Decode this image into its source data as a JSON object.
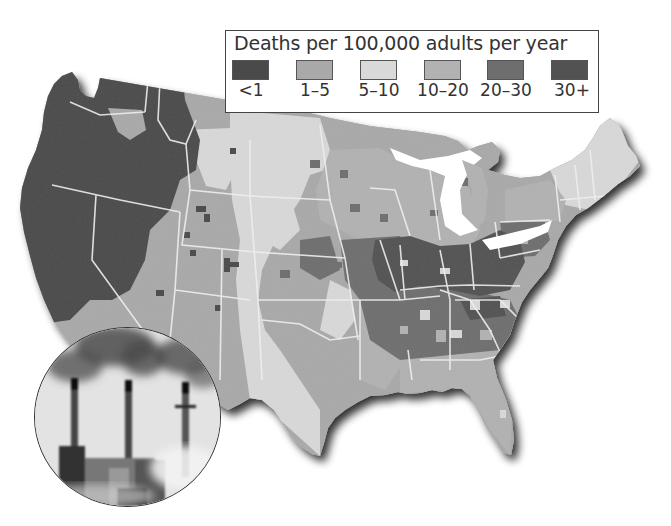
{
  "legend": {
    "title": "Deaths per 100,000 adults per year",
    "items": [
      {
        "label": "<1",
        "color": "#4a4a4a"
      },
      {
        "label": "1–5",
        "color": "#a9a9a9"
      },
      {
        "label": "5–10",
        "color": "#d9d9d9"
      },
      {
        "label": "10–20",
        "color": "#b2b2b2"
      },
      {
        "label": "20–30",
        "color": "#6e6e6e"
      },
      {
        "label": "30+",
        "color": "#525252"
      }
    ]
  },
  "map": {
    "subject": "Contiguous United States county-level death rates attributable to air pollution",
    "regions": [
      {
        "name": "Pacific Northwest & California coast",
        "category": "<1"
      },
      {
        "name": "Nevada / Idaho / western Montana",
        "category": "<1"
      },
      {
        "name": "Northern Rockies & Great Basin",
        "category": "1–5"
      },
      {
        "name": "Northern & Central Great Plains",
        "category": "5–10"
      },
      {
        "name": "Southwest (Arizona, New Mexico)",
        "category": "1–5"
      },
      {
        "name": "Texas & Oklahoma",
        "category": "5–10"
      },
      {
        "name": "Upper Midwest (Minnesota, Wisconsin, Michigan)",
        "category": "10–20"
      },
      {
        "name": "Ohio Valley (Illinois, Indiana, Ohio, Kentucky, West Virginia)",
        "category": "30+"
      },
      {
        "name": "Mid-South (Tennessee, Arkansas, Alabama, Georgia)",
        "category": "20–30"
      },
      {
        "name": "Pennsylvania & Mid-Atlantic",
        "category": "20–30"
      },
      {
        "name": "New York",
        "category": "10–20"
      },
      {
        "name": "New England",
        "category": "5–10"
      },
      {
        "name": "Gulf Coast & Florida",
        "category": "10–20"
      }
    ]
  },
  "inset": {
    "subject": "Photo of power plant smokestacks emitting smoke",
    "stack_count": 3
  }
}
